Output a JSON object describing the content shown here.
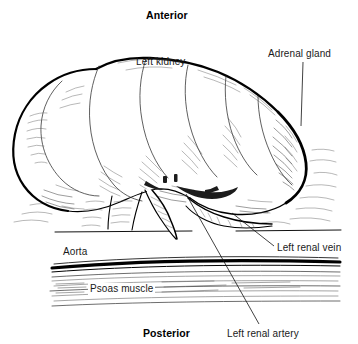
{
  "figure": {
    "width": 358,
    "height": 344,
    "background_color": "#ffffff",
    "ink_color": "#000000",
    "style": "black and white line drawing with hatch shading"
  },
  "labels": {
    "anterior": {
      "text": "Anterior",
      "bold": true,
      "x": 146,
      "y": 9,
      "has_leader": false
    },
    "left_kidney": {
      "text": "Left kidney",
      "bold": false,
      "x": 136,
      "y": 56,
      "has_leader": false
    },
    "adrenal_gland": {
      "text": "Adrenal gland",
      "bold": false,
      "x": 268,
      "y": 48,
      "has_leader": true,
      "leader_from": [
        303,
        62
      ],
      "leader_to": [
        301,
        126
      ]
    },
    "aorta": {
      "text": "Aorta",
      "bold": false,
      "x": 63,
      "y": 246,
      "has_leader": false
    },
    "psoas_muscle": {
      "text": "Psoas muscle",
      "bold": false,
      "x": 88,
      "y": 283,
      "has_leader": false
    },
    "left_renal_vein": {
      "text": "Left renal vein",
      "bold": false,
      "x": 277,
      "y": 242,
      "has_leader": true,
      "leader_from": [
        232,
        213
      ],
      "leader_to": [
        274,
        246
      ]
    },
    "left_renal_artery": {
      "text": "Left renal artery",
      "bold": false,
      "x": 227,
      "y": 328,
      "has_leader": true,
      "leader_from": [
        186,
        194
      ],
      "leader_to": [
        259,
        324
      ]
    },
    "posterior": {
      "text": "Posterior",
      "bold": true,
      "x": 143,
      "y": 327,
      "has_leader": false
    }
  },
  "structures": [
    {
      "name": "left-kidney",
      "description": "large lobulated kidney occupying upper two thirds of image"
    },
    {
      "name": "adrenal-gland",
      "description": "cap structure at right superior pole of kidney"
    },
    {
      "name": "left-renal-vein",
      "description": "vessel emerging from hilum toward lower right"
    },
    {
      "name": "left-renal-artery",
      "description": "vessel emerging from hilum behind the vein"
    },
    {
      "name": "aorta",
      "description": "thick horizontal vessel above psoas muscle band"
    },
    {
      "name": "psoas-muscle",
      "description": "horizontal striated muscle band across lower image"
    }
  ]
}
